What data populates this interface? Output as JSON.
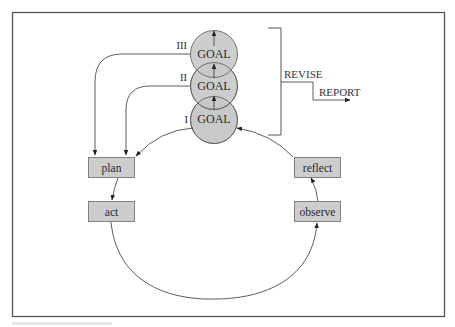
{
  "diagram": {
    "type": "action-research-cycle",
    "goals": [
      {
        "numeral": "III",
        "label": "GOAL",
        "level": 3
      },
      {
        "numeral": "II",
        "label": "GOAL",
        "level": 2
      },
      {
        "numeral": "I",
        "label": "GOAL",
        "level": 1
      }
    ],
    "cycle_steps": {
      "plan": "plan",
      "act": "act",
      "observe": "observe",
      "reflect": "reflect"
    },
    "bracket_labels": {
      "revise": "REVISE",
      "report": "REPORT"
    },
    "edges": [
      {
        "from": "GOAL III",
        "to": "plan"
      },
      {
        "from": "GOAL II",
        "to": "plan"
      },
      {
        "from": "GOAL I",
        "to": "plan"
      },
      {
        "from": "plan",
        "to": "act"
      },
      {
        "from": "act",
        "to": "observe"
      },
      {
        "from": "observe",
        "to": "reflect"
      },
      {
        "from": "reflect",
        "to": "GOAL I"
      },
      {
        "from": "GOAL I",
        "to": "GOAL II"
      },
      {
        "from": "GOAL II",
        "to": "GOAL III"
      },
      {
        "from": "REVISE",
        "to": "REPORT"
      }
    ],
    "colors": {
      "node_fill": "#c9c9c9",
      "box_fill": "#cdcdcd",
      "stroke": "#333333",
      "frame": "#555555"
    }
  }
}
